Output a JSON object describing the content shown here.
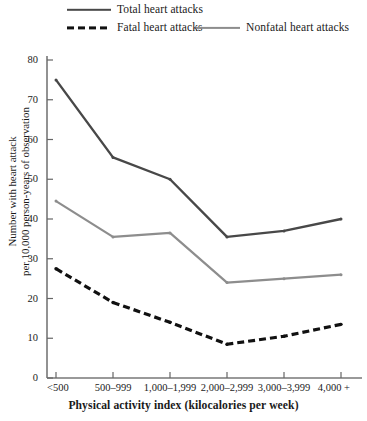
{
  "chart_data": {
    "type": "line",
    "title": "",
    "xlabel": "Physical activity index (kilocalories per week)",
    "ylabel": "Number with heart attack per 10,000 person-years of observation",
    "ylabel_line1": "Number with heart attack",
    "ylabel_line2": "per 10,000 person-years of observation",
    "categories": [
      "<500",
      "500–999",
      "1,000–1,999",
      "2,000–2,999",
      "3,000–3,999",
      "4,000 +"
    ],
    "ylim": [
      0,
      80
    ],
    "yticks": [
      0,
      10,
      20,
      30,
      40,
      50,
      60,
      70,
      80
    ],
    "grid": false,
    "legend_position": "top",
    "series": [
      {
        "name": "Total heart attacks",
        "style": "solid",
        "color": "#484848",
        "width": 2.4,
        "values": [
          75,
          55.5,
          50,
          35.5,
          37,
          40
        ]
      },
      {
        "name": "Fatal heart attacks",
        "style": "dashed",
        "color": "#111111",
        "width": 3.2,
        "values": [
          27.5,
          19,
          14,
          8.5,
          10.5,
          13.5
        ]
      },
      {
        "name": "Nonfatal heart attacks",
        "style": "solid",
        "color": "#8d8d8d",
        "width": 2.2,
        "values": [
          44.5,
          35.5,
          36.5,
          24,
          25,
          26
        ]
      }
    ]
  },
  "legend": {
    "items": [
      {
        "label": "Total heart attacks"
      },
      {
        "label": "Fatal heart attacks"
      },
      {
        "label": "Nonfatal heart attacks"
      }
    ]
  },
  "axes": {
    "y_title_line1": "Number with heart attack",
    "y_title_line2": "per 10,000 person-years of observation",
    "x_title": "Physical activity index (kilocalories per week)",
    "y_tick_labels": [
      "0",
      "10",
      "20",
      "30",
      "40",
      "50",
      "60",
      "70",
      "80"
    ],
    "x_tick_labels": [
      "<500",
      "500–999",
      "1,000–1,999",
      "2,000–2,999",
      "3,000–3,999",
      "4,000 +"
    ]
  }
}
